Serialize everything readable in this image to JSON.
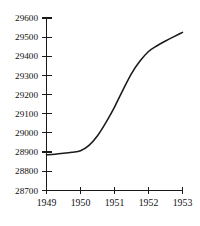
{
  "chart_data": {
    "type": "line",
    "title": "",
    "subtitle": "",
    "xlabel": "",
    "ylabel": "",
    "x": [
      1949,
      1949.25,
      1949.5,
      1949.75,
      1950,
      1950.25,
      1950.5,
      1950.75,
      1951,
      1951.25,
      1951.5,
      1951.75,
      1952,
      1952.25,
      1952.5,
      1952.75,
      1953
    ],
    "values": [
      28885,
      28888,
      28893,
      28899,
      28907,
      28935,
      28985,
      29055,
      29135,
      29225,
      29310,
      29375,
      29425,
      29455,
      29480,
      29503,
      29525
    ],
    "series": [
      {
        "name": "series-1",
        "values": [
          28885,
          28888,
          28893,
          28899,
          28907,
          28935,
          28985,
          29055,
          29135,
          29225,
          29310,
          29375,
          29425,
          29455,
          29480,
          29503,
          29525
        ]
      }
    ],
    "xlim": [
      1949,
      1953
    ],
    "ylim": [
      28700,
      29600
    ],
    "grid": false,
    "legend": false,
    "legend_position": "none",
    "line_color": "#1a1a1a",
    "axis_color": "#1a1a1a",
    "background_color": "#ffffff",
    "y_ticks": [
      28700,
      28800,
      28900,
      29000,
      29100,
      29200,
      29300,
      29400,
      29500,
      29600
    ],
    "y_tick_labels": [
      "28700",
      "28800",
      "28900",
      "29000",
      "29100",
      "29200",
      "29300",
      "29400",
      "29500",
      "29600"
    ],
    "x_ticks": [
      1949,
      1950,
      1951,
      1952,
      1953
    ],
    "x_tick_labels": [
      "1949",
      "1950",
      "1951",
      "1952",
      "1953"
    ],
    "annotations": []
  }
}
